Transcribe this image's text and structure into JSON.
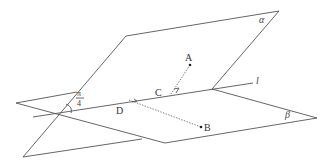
{
  "diagram": {
    "type": "dihedral-angle-geometry",
    "planes": [
      {
        "id": "alpha",
        "label": "α"
      },
      {
        "id": "beta",
        "label": "β"
      }
    ],
    "line": {
      "id": "l",
      "label": "l"
    },
    "points": [
      {
        "id": "A",
        "label": "A"
      },
      {
        "id": "B",
        "label": "B"
      },
      {
        "id": "C",
        "label": "C"
      },
      {
        "id": "D",
        "label": "D"
      }
    ],
    "angle": {
      "numerator": "π",
      "denominator": "4"
    },
    "segments": [
      {
        "from": "A",
        "to": "C",
        "style": "dotted",
        "perpendicular_mark": true
      },
      {
        "from": "B",
        "to": "D",
        "style": "dotted",
        "perpendicular_mark": true
      }
    ],
    "colors": {
      "stroke": "#555555",
      "background": "#ffffff"
    }
  }
}
